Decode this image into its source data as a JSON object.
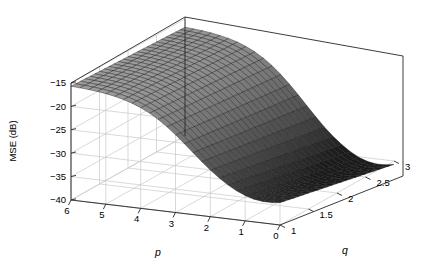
{
  "figure": {
    "background_color": "#ffffff",
    "box_line_color": "#262626",
    "grid_line_color": "#c8c8c8",
    "mesh_line_color": "#1a1a1a"
  },
  "chart_data": {
    "type": "surface",
    "title": "",
    "xlabel": "p",
    "ylabel": "q",
    "zlabel": "MSE (dB)",
    "grid": true,
    "legend": null,
    "projection": "3d",
    "view": {
      "azimuth": -37.5,
      "elevation": 30
    },
    "xlim": [
      0,
      6
    ],
    "ylim": [
      1,
      3
    ],
    "zlim": [
      -40,
      -15
    ],
    "xticks": [
      6,
      5,
      4,
      3,
      2,
      1,
      0
    ],
    "xticklabels": [
      "6",
      "5",
      "4",
      "3",
      "2",
      "1",
      "0"
    ],
    "yticks": [
      1,
      1.5,
      2,
      2.5,
      3
    ],
    "yticklabels": [
      "1",
      "1.5",
      "2",
      "2.5",
      "3"
    ],
    "zticks": [
      -15,
      -20,
      -25,
      -30,
      -35,
      -40
    ],
    "zticklabels": [
      "-15",
      "-20",
      "-25",
      "-30",
      "-35",
      "-40"
    ],
    "x": [
      0,
      0.25,
      0.5,
      0.75,
      1,
      1.25,
      1.5,
      1.75,
      2,
      2.25,
      2.5,
      2.75,
      3,
      3.25,
      3.5,
      3.75,
      4,
      4.25,
      4.5,
      4.75,
      5,
      5.25,
      5.5,
      5.75,
      6
    ],
    "y": [
      1,
      1.083,
      1.167,
      1.25,
      1.333,
      1.417,
      1.5,
      1.583,
      1.667,
      1.75,
      1.833,
      1.917,
      2,
      2.083,
      2.167,
      2.25,
      2.333,
      2.417,
      2.5,
      2.583,
      2.667,
      2.75,
      2.833,
      2.917,
      3
    ],
    "z_description": "MSE in dB over the (p,q) grid: high plateau near -15 dB at large p (back-left), falling monotonically to a broad minimum around -38 dB near p=0.75-1.5, rising slightly toward p=0; mild additional decrease with increasing q.",
    "z_row_labels": [
      "q=1",
      "q=1.5",
      "q=2",
      "q=2.5",
      "q=3"
    ],
    "z_col_labels": [
      "p=6",
      "p=5",
      "p=4",
      "p=3",
      "p=2",
      "p=1",
      "p=0"
    ],
    "z_samples": [
      [
        -15.4,
        -15.9,
        -17.2,
        -21.0,
        -27.6,
        -34.0,
        -33.2
      ],
      [
        -15.6,
        -16.2,
        -17.8,
        -22.0,
        -29.0,
        -35.4,
        -34.3
      ],
      [
        -15.8,
        -16.6,
        -18.5,
        -23.1,
        -30.4,
        -36.6,
        -35.3
      ],
      [
        -16.1,
        -17.0,
        -19.2,
        -24.2,
        -31.7,
        -37.5,
        -36.1
      ],
      [
        -16.4,
        -17.4,
        -19.9,
        -25.2,
        -32.8,
        -38.1,
        -36.8
      ]
    ],
    "zmin_value": -38.1,
    "zmax_value": -15.4,
    "surface_shading": "gray colormap, light at high MSE, dark at low MSE",
    "mesh_rows": 25,
    "mesh_cols": 25
  }
}
